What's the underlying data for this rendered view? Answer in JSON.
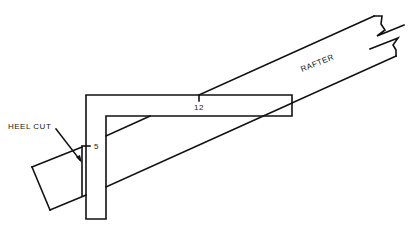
{
  "diagram": {
    "labels": {
      "rafter": "RAFTER",
      "heel_cut": "HEEL CUT",
      "tongue_mark": "5",
      "blade_mark": "12"
    },
    "colors": {
      "line": "#111111",
      "background": "#ffffff"
    }
  }
}
